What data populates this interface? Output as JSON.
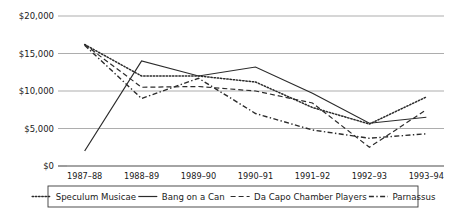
{
  "chart_data": {
    "type": "line",
    "title": "",
    "xlabel": "",
    "ylabel": "",
    "categories": [
      "1987–88",
      "1988–89",
      "1989–90",
      "1990–91",
      "1991–92",
      "1992–93",
      "1993–94"
    ],
    "ylim": [
      0,
      20000
    ],
    "yticks": [
      0,
      5000,
      10000,
      15000,
      20000
    ],
    "ytick_labels": [
      "$0",
      "$5,000",
      "$10,000",
      "$15,000",
      "$20,000"
    ],
    "grid": true,
    "legend_position": "bottom",
    "series": [
      {
        "name": "Speculum Musicae",
        "style": "dotted",
        "values": [
          16200,
          12000,
          12000,
          11200,
          7800,
          5600,
          9200
        ]
      },
      {
        "name": "Bang on a Can",
        "style": "solid",
        "values": [
          2000,
          14000,
          12000,
          13200,
          9700,
          5700,
          6500
        ]
      },
      {
        "name": "Da Capo Chamber Players",
        "style": "dashed",
        "values": [
          16200,
          10500,
          10600,
          10000,
          8400,
          2500,
          7500
        ]
      },
      {
        "name": "Parnassus",
        "style": "dash-dot",
        "values": [
          16100,
          9000,
          11700,
          7000,
          4800,
          3700,
          4300
        ]
      }
    ]
  },
  "legend": {
    "items": [
      {
        "label": "Speculum Musicae",
        "style": "dotted"
      },
      {
        "label": "Bang on a Can",
        "style": "solid"
      },
      {
        "label": "Da Capo Chamber Players",
        "style": "dashed"
      },
      {
        "label": "Parnassus",
        "style": "dash-dot"
      }
    ]
  },
  "colors": {
    "line": "#2b2b2b",
    "grid": "#8a8a8a",
    "axis": "#4a4a4a",
    "background": "#ffffff",
    "text": "#1a1a1a"
  }
}
